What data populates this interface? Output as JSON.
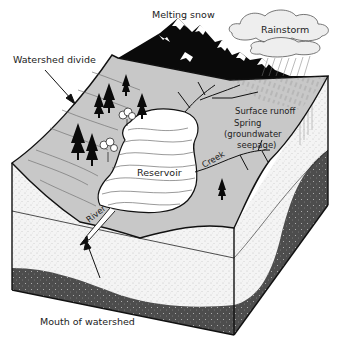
{
  "diagram": {
    "type": "watershed block diagram",
    "labels": {
      "melting_snow": "Melting snow",
      "rainstorm": "Rainstorm",
      "watershed_divide": "Watershed divide",
      "surface_runoff": "Surface runoff",
      "spring_line1": "Spring",
      "spring_line2": "(groundwater",
      "spring_line3": "seepage)",
      "reservoir": "Reservoir",
      "creek": "Creek",
      "river": "River",
      "mouth_of_watershed": "Mouth of watershed"
    },
    "colors": {
      "surface": "#c8c8c8",
      "soil": "#f2f2f2",
      "bedrock": "#4a4a4a",
      "outline": "#111111",
      "mountain": "#0a0a0a",
      "water": "#ffffff"
    }
  }
}
